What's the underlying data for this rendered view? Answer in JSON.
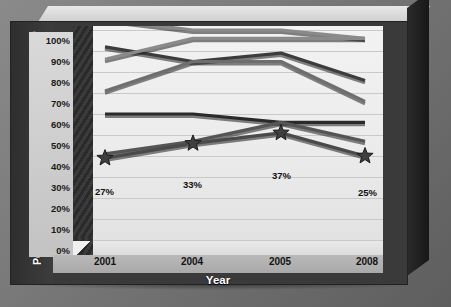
{
  "chart_data": {
    "type": "line",
    "title": "",
    "xlabel": "Year",
    "ylabel": "Percent considering this issue a \"top priority\"",
    "categories": [
      "2001",
      "2004",
      "2005",
      "2008"
    ],
    "x_tick_labels": [
      "2001",
      "2004",
      "2005",
      "2008"
    ],
    "y_tick_labels": [
      "100%",
      "90%",
      "80%",
      "70%",
      "60%",
      "50%",
      "40%",
      "30%",
      "20%",
      "10%",
      "0%"
    ],
    "y_tick_values": [
      100,
      90,
      80,
      70,
      60,
      50,
      40,
      30,
      20,
      10,
      0
    ],
    "ylim": [
      0,
      110
    ],
    "grid": true,
    "legend": "none",
    "series": [
      {
        "name": "series-1",
        "values": [
          105,
          100,
          100,
          96
        ],
        "color": "#8a8a8a"
      },
      {
        "name": "series-2",
        "values": [
          92,
          85,
          89,
          76
        ],
        "color": "#3c3c3c"
      },
      {
        "name": "series-3",
        "values": [
          86,
          96,
          96,
          96
        ],
        "color": "#8a8a8a"
      },
      {
        "name": "series-4",
        "values": [
          71,
          85,
          85,
          66
        ],
        "color": "#6e6e6e"
      },
      {
        "name": "series-5",
        "values": [
          60,
          60,
          56,
          56
        ],
        "color": "#2a2a2a"
      },
      {
        "name": "series-6",
        "values": [
          41,
          47,
          56,
          47
        ],
        "color": "#555555"
      },
      {
        "name": "series-7",
        "values": [
          39,
          46,
          51,
          40
        ],
        "color": "#4a4a4a",
        "markers": "star"
      }
    ],
    "data_labels": [
      {
        "text": "27%",
        "category": "2001"
      },
      {
        "text": "33%",
        "category": "2004"
      },
      {
        "text": "37%",
        "category": "2005"
      },
      {
        "text": "25%",
        "category": "2008"
      }
    ],
    "marker_shape": "star",
    "style": "3d-grayscale"
  },
  "axis": {
    "y_title": "Percent considering this issue a \"top priority\"",
    "x_title": "Year",
    "y_ticks": [
      "100%",
      "90%",
      "80%",
      "70%",
      "60%",
      "50%",
      "40%",
      "30%",
      "20%",
      "10%",
      "0%"
    ],
    "x_ticks": [
      "2001",
      "2004",
      "2005",
      "2008"
    ]
  },
  "labels": {
    "d0": "27%",
    "d1": "33%",
    "d2": "37%",
    "d3": "25%"
  },
  "colors": {
    "background": "#6d6d6d",
    "plot_area": "#efefef",
    "gridline": "#c9c9c9",
    "wall": "#3a3a3a",
    "text_light": "#ffffff",
    "text_dark": "#141414"
  }
}
